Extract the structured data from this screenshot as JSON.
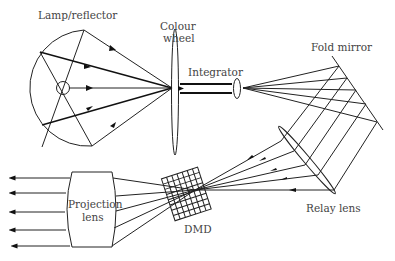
{
  "diagram": {
    "labels": {
      "lamp": "Lamp/reflector",
      "colour_wheel_1": "Colour",
      "colour_wheel_2": "wheel",
      "integrator": "Integrator",
      "fold_mirror": "Fold mirror",
      "projection_lens_1": "Projection",
      "projection_lens_2": "lens",
      "dmd": "DMD",
      "relay_lens": "Relay lens"
    },
    "components": [
      "Lamp/reflector",
      "Colour wheel",
      "Integrator",
      "Fold mirror",
      "Relay lens",
      "DMD",
      "Projection lens"
    ],
    "colors": {
      "stroke": "#222222",
      "text": "#444444",
      "background": "#ffffff"
    }
  }
}
